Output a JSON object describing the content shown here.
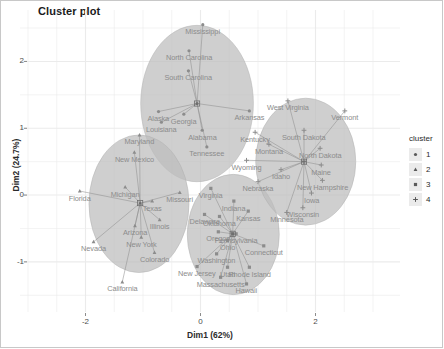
{
  "title": "Cluster plot",
  "axes": {
    "x": {
      "label": "Dim1 (62%)",
      "ticks": [
        "-2",
        "0",
        "2"
      ],
      "tick_values": [
        -2,
        0,
        2
      ],
      "range": [
        -3.0,
        3.4
      ]
    },
    "y": {
      "label": "Dim2 (24.7%)",
      "ticks": [
        "-1",
        "0",
        "1",
        "2"
      ],
      "tick_values": [
        -1,
        0,
        1,
        2
      ],
      "range": [
        -1.75,
        2.65
      ]
    }
  },
  "legend": {
    "title": "cluster",
    "items": [
      {
        "label": "1",
        "shape": "circle"
      },
      {
        "label": "2",
        "shape": "triangle"
      },
      {
        "label": "3",
        "shape": "square"
      },
      {
        "label": "4",
        "shape": "plus"
      }
    ]
  },
  "colors": {
    "cluster_fill": "#bdbdbd",
    "point": "#8c8c8c",
    "label": "#8c8c8c",
    "grid": "#ebebeb",
    "axis_text": "#4d4d4d",
    "title": "#1a1a1a",
    "background": "#ffffff"
  },
  "chart_data": {
    "type": "scatter",
    "title": "Cluster plot",
    "xlabel": "Dim1 (62%)",
    "ylabel": "Dim2 (24.7%)",
    "xlim": [
      -3.0,
      3.4
    ],
    "ylim": [
      -1.75,
      2.65
    ],
    "grid": true,
    "legend_position": "right",
    "legend_title": "cluster",
    "clusters": [
      {
        "cluster": 1,
        "shape": "circle",
        "centroid": {
          "x": -0.06,
          "y": 1.37
        },
        "hull": {
          "cx": -0.06,
          "cy": 1.37,
          "rx": 0.98,
          "ry": 1.17
        },
        "points": [
          {
            "label": "Mississippi",
            "x": 0.04,
            "y": 2.55
          },
          {
            "label": "North Carolina",
            "x": -0.2,
            "y": 2.16
          },
          {
            "label": "South Carolina",
            "x": -0.21,
            "y": 1.86
          },
          {
            "label": "Georgia",
            "x": -0.29,
            "y": 1.21
          },
          {
            "label": "Alabama",
            "x": 0.03,
            "y": 0.97
          },
          {
            "label": "Tennessee",
            "x": 0.11,
            "y": 0.72
          },
          {
            "label": "Arkansas",
            "x": 0.85,
            "y": 1.26
          },
          {
            "label": "Louisiana",
            "x": -0.68,
            "y": 1.09
          },
          {
            "label": "Alaska",
            "x": -0.73,
            "y": 1.25
          }
        ]
      },
      {
        "cluster": 2,
        "shape": "triangle",
        "centroid": {
          "x": -1.05,
          "y": -0.12
        },
        "hull": {
          "cx": -1.07,
          "cy": -0.13,
          "rx": 0.87,
          "ry": 1.03
        },
        "points": [
          {
            "label": "Maryland",
            "x": -1.06,
            "y": 0.9
          },
          {
            "label": "New Mexico",
            "x": -1.15,
            "y": 0.64
          },
          {
            "label": "Florida",
            "x": -2.1,
            "y": 0.06
          },
          {
            "label": "Michigan",
            "x": -1.31,
            "y": 0.12
          },
          {
            "label": "Texas",
            "x": -0.84,
            "y": -0.09
          },
          {
            "label": "Missouri",
            "x": -0.36,
            "y": 0.04
          },
          {
            "label": "Illinois",
            "x": -0.71,
            "y": -0.37
          },
          {
            "label": "Arizona",
            "x": -1.14,
            "y": -0.46
          },
          {
            "label": "New York",
            "x": -1.03,
            "y": -0.63
          },
          {
            "label": "Nevada",
            "x": -1.86,
            "y": -0.7
          },
          {
            "label": "Colorado",
            "x": -0.8,
            "y": -0.86
          },
          {
            "label": "California",
            "x": -1.36,
            "y": -1.3
          }
        ]
      },
      {
        "cluster": 3,
        "shape": "square",
        "centroid": {
          "x": 0.56,
          "y": -0.58
        },
        "hull": {
          "cx": 0.57,
          "cy": -0.59,
          "rx": 0.8,
          "ry": 0.9
        },
        "points": [
          {
            "label": "Virginia",
            "x": 0.18,
            "y": 0.1
          },
          {
            "label": "Indiana",
            "x": 0.58,
            "y": -0.09
          },
          {
            "label": "Kansas",
            "x": 0.83,
            "y": -0.24
          },
          {
            "label": "Oklahoma",
            "x": 0.33,
            "y": -0.32
          },
          {
            "label": "Delaware",
            "x": 0.07,
            "y": -0.29
          },
          {
            "label": "Oregon",
            "x": 0.31,
            "y": -0.55
          },
          {
            "label": "Pennsylvania",
            "x": 0.62,
            "y": -0.58
          },
          {
            "label": "Ohio",
            "x": 0.47,
            "y": -0.68
          },
          {
            "label": "Washington",
            "x": 0.28,
            "y": -0.88
          },
          {
            "label": "Connecticut",
            "x": 1.1,
            "y": -0.76
          },
          {
            "label": "New Jersey",
            "x": -0.06,
            "y": -1.07
          },
          {
            "label": "Utah",
            "x": 0.47,
            "y": -1.08
          },
          {
            "label": "Rhode Island",
            "x": 0.85,
            "y": -1.08
          },
          {
            "label": "Massachusetts",
            "x": 0.35,
            "y": -1.23
          },
          {
            "label": "Hawaii",
            "x": 0.8,
            "y": -1.33
          }
        ]
      },
      {
        "cluster": 4,
        "shape": "plus",
        "centroid": {
          "x": 1.8,
          "y": 0.5
        },
        "hull": {
          "cx": 1.83,
          "cy": 0.5,
          "rx": 0.87,
          "ry": 0.95
        },
        "points": [
          {
            "label": "West Virginia",
            "x": 1.52,
            "y": 1.41
          },
          {
            "label": "Vermont",
            "x": 2.51,
            "y": 1.26
          },
          {
            "label": "South Dakota",
            "x": 1.8,
            "y": 0.97
          },
          {
            "label": "North Dakota",
            "x": 2.08,
            "y": 0.7
          },
          {
            "label": "Maine",
            "x": 2.1,
            "y": 0.45
          },
          {
            "label": "New Hampshire",
            "x": 2.12,
            "y": 0.22
          },
          {
            "label": "Iowa",
            "x": 1.93,
            "y": 0.03
          },
          {
            "label": "Wisconsin",
            "x": 1.78,
            "y": -0.19
          },
          {
            "label": "Minnesota",
            "x": 1.5,
            "y": -0.26
          },
          {
            "label": "Idaho",
            "x": 1.4,
            "y": 0.38
          },
          {
            "label": "Montana",
            "x": 1.19,
            "y": 0.76
          },
          {
            "label": "Kentucky",
            "x": 0.95,
            "y": 0.94
          },
          {
            "label": "Nebraska",
            "x": 1.0,
            "y": 0.2
          },
          {
            "label": "Wyoming",
            "x": 0.8,
            "y": 0.52
          }
        ]
      }
    ]
  }
}
